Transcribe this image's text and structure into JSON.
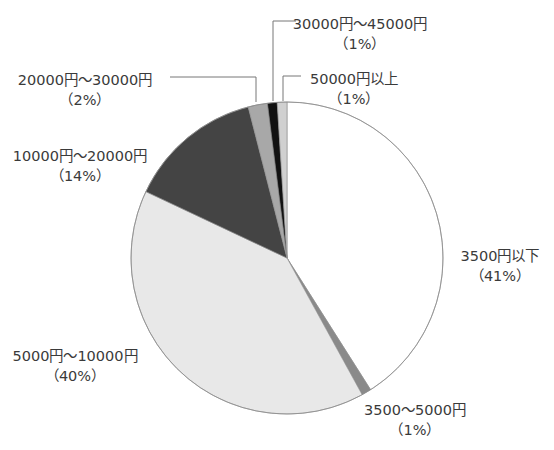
{
  "chart_data": {
    "type": "pie",
    "title": "",
    "start_angle_deg": 0,
    "direction": "clockwise",
    "center": [
      287,
      258
    ],
    "radius": 156,
    "slices": [
      {
        "label": "3500円以下",
        "pct_label": "（41%）",
        "value": 41,
        "color": "#ffffff"
      },
      {
        "label": "3500〜5000円",
        "pct_label": "（1%）",
        "value": 1,
        "color": "#8a8a8a"
      },
      {
        "label": "5000円〜10000円",
        "pct_label": "（40%）",
        "value": 40,
        "color": "#e8e8e8"
      },
      {
        "label": "10000円〜20000円",
        "pct_label": "（14%）",
        "value": 14,
        "color": "#444444"
      },
      {
        "label": "20000円〜30000円",
        "pct_label": "（2%）",
        "value": 2,
        "color": "#a8a8a8"
      },
      {
        "label": "30000円〜45000円",
        "pct_label": "（1%）",
        "value": 1,
        "color": "#111111"
      },
      {
        "label": "50000円以上",
        "pct_label": "（1%）",
        "value": 1,
        "color": "#d0d0d0"
      }
    ]
  },
  "labels": [
    {
      "name": "label-under-3500",
      "x": 500,
      "y": 246,
      "line1": "3500円以下",
      "line2": "（41%）"
    },
    {
      "name": "label-3500-5000",
      "x": 415,
      "y": 400,
      "line1": "3500〜5000円",
      "line2": "（1%）"
    },
    {
      "name": "label-5000-10000",
      "x": 75,
      "y": 346,
      "line1": "5000円〜10000円",
      "line2": "（40%）"
    },
    {
      "name": "label-10000-20000",
      "x": 80,
      "y": 146,
      "line1": "10000円〜20000円",
      "line2": "（14%）"
    },
    {
      "name": "label-20000-30000",
      "x": 85,
      "y": 70,
      "line1": "20000円〜30000円",
      "line2": "（2%）"
    },
    {
      "name": "label-30000-45000",
      "x": 360,
      "y": 14,
      "line1": "30000円〜45000円",
      "line2": "（1%）"
    },
    {
      "name": "label-over-50000",
      "x": 354,
      "y": 69,
      "line1": "50000円以上",
      "line2": "（1%）"
    }
  ],
  "leaders": [
    {
      "name": "leader-20000-30000",
      "points": [
        [
          170,
          77
        ],
        [
          256,
          77
        ],
        [
          256,
          102
        ]
      ]
    },
    {
      "name": "leader-30000-45000",
      "points": [
        [
          296,
          21
        ],
        [
          273,
          21
        ],
        [
          273,
          101
        ]
      ]
    },
    {
      "name": "leader-over-50000",
      "points": [
        [
          301,
          76
        ],
        [
          283,
          76
        ],
        [
          283,
          101
        ]
      ]
    }
  ]
}
